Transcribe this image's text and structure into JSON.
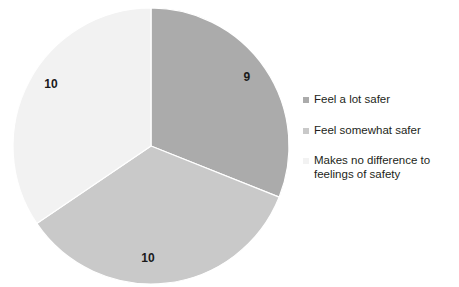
{
  "chart_data": {
    "type": "pie",
    "title": "",
    "subtitle": "",
    "xlabel": "",
    "ylabel": "",
    "grid": false,
    "legend_position": "right",
    "start_angle_deg": 0,
    "direction": "clockwise",
    "total": 29,
    "categories": [
      "Feel a lot safer",
      "Feel somewhat safer",
      "Makes no difference to feelings of safety"
    ],
    "values": [
      9,
      10,
      10
    ],
    "data_labels": [
      "9",
      "10",
      "10"
    ],
    "colors": [
      "#ababab",
      "#c9c9c9",
      "#f2f2f2"
    ],
    "slices": [
      {
        "label": "Feel a lot safer",
        "value": 9,
        "data_label": "9",
        "color": "#ababab",
        "start_deg": 0,
        "end_deg": 111.72,
        "label_x": 247,
        "label_y": 77
      },
      {
        "label": "Feel somewhat safer",
        "value": 10,
        "data_label": "10",
        "color": "#c9c9c9",
        "start_deg": 111.72,
        "end_deg": 235.86,
        "label_x": 148,
        "label_y": 258
      },
      {
        "label": "Makes no difference to feelings of safety",
        "value": 10,
        "data_label": "10",
        "color": "#f2f2f2",
        "start_deg": 235.86,
        "end_deg": 360,
        "label_x": 51,
        "label_y": 84
      }
    ],
    "geometry": {
      "center_x": 151,
      "center_y": 146,
      "radius": 138
    }
  },
  "legend": {
    "items": [
      {
        "label": "Feel a lot safer",
        "color": "#ababab"
      },
      {
        "label": "Feel somewhat safer",
        "color": "#c9c9c9"
      },
      {
        "label": "Makes no difference to\nfeelings of safety",
        "color": "#f2f2f2"
      }
    ]
  }
}
